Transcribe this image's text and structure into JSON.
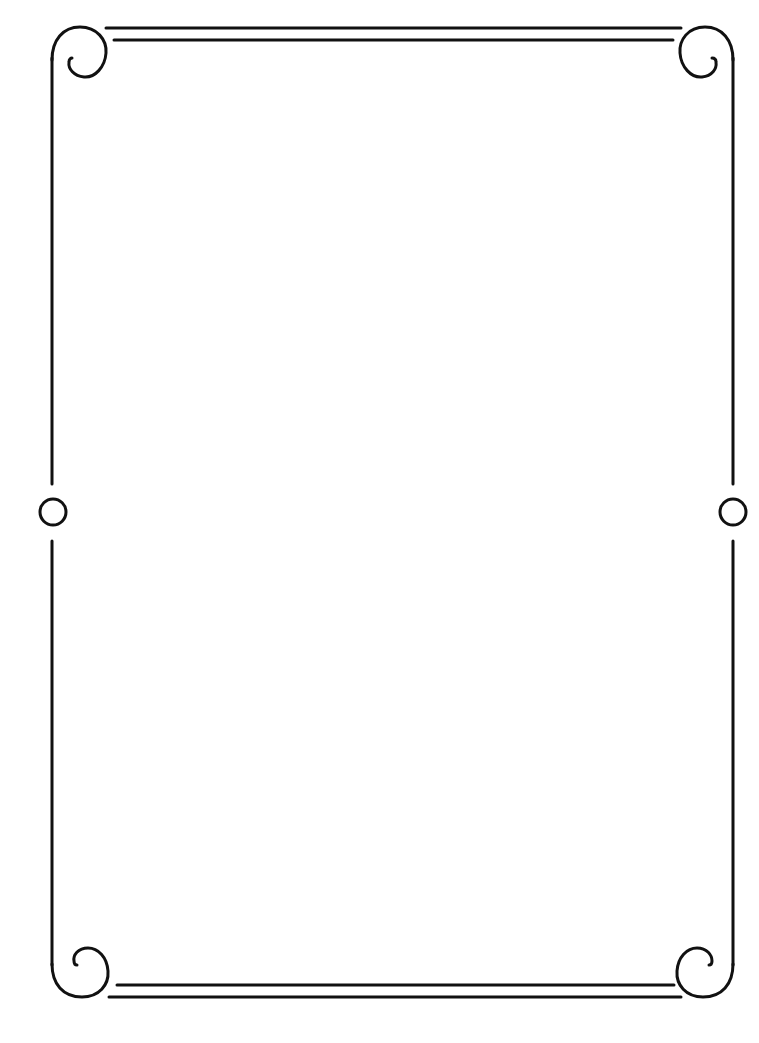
{
  "page": {
    "background": "#ffffff",
    "stroke_color": "#111111",
    "stroke_width": 3
  },
  "frame": {
    "style": "ornamental-scroll-border",
    "corners": [
      "top-left-scroll",
      "top-right-scroll",
      "bottom-left-scroll",
      "bottom-right-scroll"
    ],
    "side_ornaments": [
      "left-ring",
      "right-ring"
    ],
    "content": ""
  }
}
